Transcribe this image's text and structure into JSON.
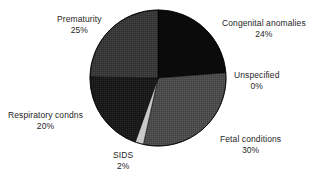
{
  "chart_data": {
    "type": "pie",
    "title": "",
    "subtitle": "",
    "xlabel": "",
    "ylabel": "",
    "legend_position": "none",
    "grid": false,
    "label_format": "name above percentage",
    "total_percent": 101,
    "center": {
      "x": 158,
      "y": 78
    },
    "radius": 68,
    "start_angle_deg": 0,
    "direction": "clockwise",
    "categories": [
      "Congenital anomalies",
      "Unspecified",
      "Fetal conditions",
      "SIDS",
      "Respiratory condns",
      "Prematurity"
    ],
    "values": [
      24,
      0,
      30,
      2,
      20,
      25
    ],
    "slices": [
      {
        "name": "Congenital anomalies",
        "value": 24,
        "percent_label": "24%",
        "color": "#0b0b0b",
        "start_deg": 0,
        "end_deg": 86.4,
        "label_anchor": "left"
      },
      {
        "name": "Unspecified",
        "value": 0,
        "percent_label": "0%",
        "color": "#7d7d7d",
        "start_deg": 86.4,
        "end_deg": 88.2,
        "label_anchor": "left"
      },
      {
        "name": "Fetal conditions",
        "value": 30,
        "percent_label": "30%",
        "color": "#4c4c4c",
        "start_deg": 88.2,
        "end_deg": 196.2,
        "label_anchor": "left"
      },
      {
        "name": "SIDS",
        "value": 2,
        "percent_label": "2%",
        "color": "#c9c9c9",
        "start_deg": 196.2,
        "end_deg": 203.4,
        "label_anchor": "center"
      },
      {
        "name": "Respiratory condns",
        "value": 20,
        "percent_label": "20%",
        "color": "#1b1b1b",
        "start_deg": 203.4,
        "end_deg": 275.4,
        "label_anchor": "right"
      },
      {
        "name": "Prematurity",
        "value": 25,
        "percent_label": "25%",
        "color": "#393939",
        "start_deg": 275.4,
        "end_deg": 365.4,
        "label_anchor": "center"
      }
    ]
  },
  "labels": {
    "congenital": {
      "name": "Congenital anomalies",
      "pct": "24%"
    },
    "unspecified": {
      "name": "Unspecified",
      "pct": "0%"
    },
    "fetal": {
      "name": "Fetal conditions",
      "pct": "30%"
    },
    "sids": {
      "name": "SIDS",
      "pct": "2%"
    },
    "respiratory": {
      "name": "Respiratory condns",
      "pct": "20%"
    },
    "prematurity": {
      "name": "Prematurity",
      "pct": "25%"
    }
  },
  "colors": {
    "background": "#ffffff",
    "text": "#262626",
    "outline": "#000000"
  }
}
